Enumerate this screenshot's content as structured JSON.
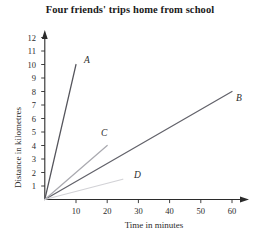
{
  "chart_data": {
    "type": "line",
    "title": "Four friends' trips home from school",
    "xlabel": "Time in minutes",
    "ylabel": "Distance in kilometres",
    "xlim": [
      0,
      65
    ],
    "ylim": [
      0,
      12.6
    ],
    "xticks": [
      10,
      20,
      30,
      40,
      50,
      60
    ],
    "yticks": [
      1,
      2,
      3,
      4,
      5,
      6,
      7,
      8,
      9,
      10,
      11,
      12
    ],
    "grid": false,
    "legend": "none",
    "series": [
      {
        "name": "A",
        "label": "A",
        "color": "#55555c",
        "points": [
          [
            0,
            0
          ],
          [
            10,
            10
          ]
        ],
        "x": [
          0,
          10
        ],
        "values": [
          0,
          10
        ]
      },
      {
        "name": "B",
        "label": "B",
        "color": "#62626a",
        "points": [
          [
            0,
            0
          ],
          [
            60,
            8
          ]
        ],
        "x": [
          0,
          60
        ],
        "values": [
          0,
          8
        ]
      },
      {
        "name": "C",
        "label": "C",
        "color": "#aaaab0",
        "points": [
          [
            0,
            0
          ],
          [
            20,
            4
          ]
        ],
        "x": [
          0,
          20
        ],
        "values": [
          0,
          4
        ]
      },
      {
        "name": "D",
        "label": "D",
        "color": "#d2d2d6",
        "points": [
          [
            0,
            0
          ],
          [
            25,
            1.5
          ]
        ],
        "x": [
          0,
          25
        ],
        "values": [
          0,
          1.5
        ]
      }
    ]
  },
  "axes": {
    "x_tick_labels": [
      "10",
      "20",
      "30",
      "40",
      "50",
      "60"
    ],
    "y_tick_labels": [
      "1",
      "2",
      "3",
      "4",
      "5",
      "6",
      "7",
      "8",
      "9",
      "10",
      "11",
      "12"
    ],
    "axis_color": "#2b2b2b"
  }
}
